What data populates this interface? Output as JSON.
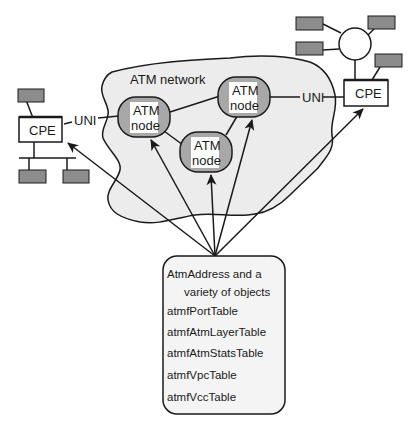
{
  "diagram": {
    "type": "network-management-diagram",
    "colors": {
      "cloud_fill": "#ececec",
      "node_shade": "#a8a8a8",
      "node_face": "#ffffff",
      "device_fill": "#8c8c8c",
      "stroke": "#1a1a1a",
      "box_fill": "#f4f4f4"
    },
    "network": {
      "label": "ATM network"
    },
    "nodes": [
      {
        "id": "node-left",
        "line1": "ATM",
        "line2": "node"
      },
      {
        "id": "node-right",
        "line1": "ATM",
        "line2": "node"
      },
      {
        "id": "node-bottom",
        "line1": "ATM",
        "line2": "node"
      }
    ],
    "left_cpe": {
      "label": "CPE",
      "interface": "UNI"
    },
    "right_cpe": {
      "label": "CPE",
      "interface": "UNI"
    },
    "mib_box": {
      "title_line1": "AtmAddress and a",
      "title_line2": "variety of objects",
      "tables": [
        "atmfPortTable",
        "atmfAtmLayerTable",
        "atmfAtmStatsTable",
        "atmfVpcTable",
        "atmfVccTable"
      ]
    }
  }
}
